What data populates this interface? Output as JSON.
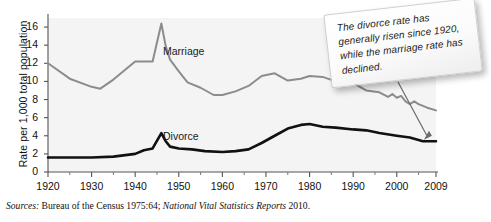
{
  "figure": {
    "y_axis_title": "Rate per 1,000 total population",
    "source_lead": "Sources:",
    "source_part1": " Bureau of the Census 1975:64; ",
    "source_italic": "National Vital Statistics Reports",
    "source_part2": " 2010."
  },
  "callout": {
    "text": "The divorce rate has generally risen since 1920, while the marriage rate has declined."
  },
  "chart_data": {
    "type": "line",
    "title": "",
    "xlabel": "",
    "ylabel": "Rate per 1,000 total population",
    "xlim": [
      1920,
      2009
    ],
    "ylim": [
      0,
      17
    ],
    "grid": false,
    "legend": "inline-labels",
    "yticks": [
      0,
      2,
      4,
      6,
      8,
      10,
      12,
      14,
      16
    ],
    "ytick_labels": [
      "0",
      "2",
      "4",
      "6",
      "8",
      "10",
      "12",
      "14",
      "16"
    ],
    "xticks": [
      1920,
      1930,
      1940,
      1950,
      1960,
      1970,
      1980,
      1990,
      2000,
      2009
    ],
    "xtick_labels": [
      "1920",
      "1930",
      "1940",
      "1950",
      "1960",
      "1970",
      "1980",
      "1990",
      "2000",
      "2009"
    ],
    "xminor_ticks": [
      1925,
      1935,
      1945,
      1955,
      1965,
      1975,
      1985,
      1995,
      2005
    ],
    "series": [
      {
        "name": "Marriage",
        "color": "#8c8c8c",
        "label_x": 1957,
        "label_y": 14.2,
        "x": [
          1920,
          1925,
          1930,
          1932,
          1935,
          1940,
          1941,
          1942,
          1944,
          1946,
          1947,
          1948,
          1950,
          1952,
          1955,
          1958,
          1960,
          1963,
          1966,
          1969,
          1972,
          1975,
          1978,
          1980,
          1983,
          1986,
          1990,
          1993,
          1996,
          1998,
          1999,
          2000,
          2001,
          2002,
          2003,
          2004,
          2005,
          2006,
          2007,
          2009
        ],
        "values": [
          12.0,
          10.3,
          9.4,
          9.2,
          10.2,
          12.2,
          12.2,
          12.2,
          12.2,
          16.4,
          13.9,
          12.4,
          11.1,
          9.9,
          9.3,
          8.5,
          8.5,
          8.9,
          9.5,
          10.6,
          10.9,
          10.1,
          10.3,
          10.6,
          10.5,
          10.0,
          9.8,
          9.0,
          8.8,
          8.3,
          8.6,
          8.2,
          8.4,
          7.8,
          7.5,
          7.8,
          7.5,
          7.3,
          7.1,
          6.8
        ]
      },
      {
        "name": "Divorce",
        "color": "#111111",
        "label_x": 1957,
        "label_y": 4.4,
        "x": [
          1920,
          1925,
          1930,
          1935,
          1940,
          1942,
          1944,
          1946,
          1947,
          1948,
          1950,
          1953,
          1956,
          1960,
          1963,
          1966,
          1969,
          1972,
          1975,
          1978,
          1980,
          1983,
          1986,
          1990,
          1993,
          1996,
          2000,
          2003,
          2006,
          2009
        ],
        "values": [
          1.6,
          1.6,
          1.6,
          1.7,
          2.0,
          2.4,
          2.6,
          4.3,
          3.4,
          2.8,
          2.6,
          2.5,
          2.3,
          2.2,
          2.3,
          2.5,
          3.2,
          4.0,
          4.8,
          5.2,
          5.3,
          5.0,
          4.9,
          4.7,
          4.6,
          4.3,
          4.0,
          3.8,
          3.4,
          3.4
        ]
      }
    ]
  }
}
